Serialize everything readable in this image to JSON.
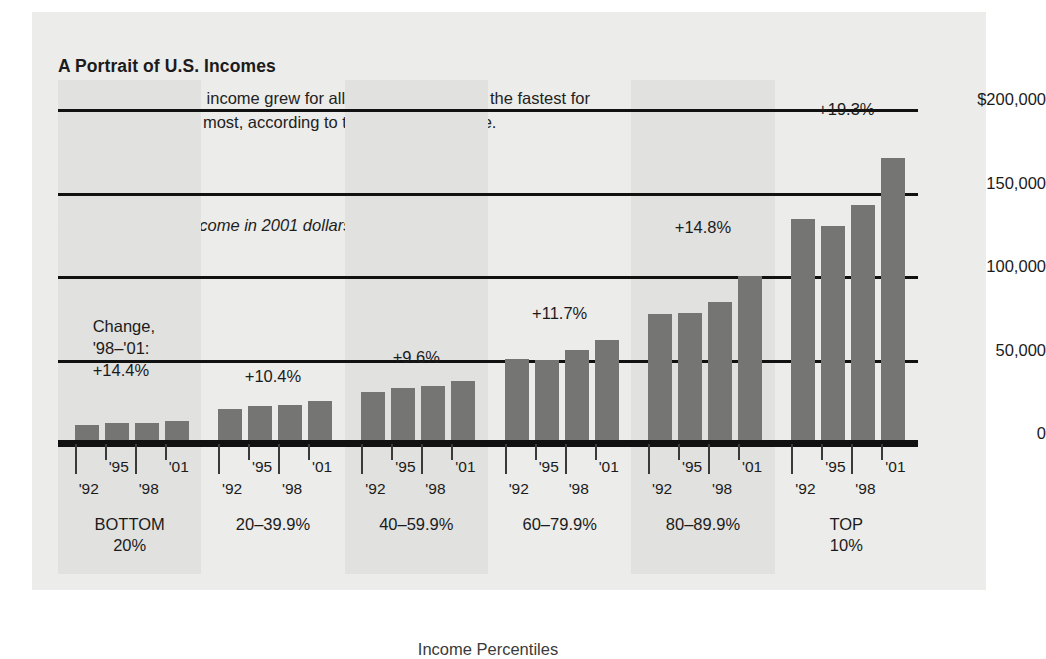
{
  "title": "A Portrait of U.S. Incomes",
  "deck": "From 1998 to 2001, income grew for all groups, but it grew the fastest for those who earn the most, according to the Federal Reserve.",
  "subhead": "Before-tax family income in 2001 dollars, by income level.",
  "x_caption": "Income Percentiles",
  "change_legend": {
    "line1": "Change,",
    "line2": "'98–'01:",
    "line3": "+14.4%"
  },
  "colors": {
    "bar": "#757573",
    "panel": "#ececea",
    "band": "#e1e1df",
    "rule": "#111111"
  },
  "chart_data": {
    "type": "bar",
    "title": "A Portrait of U.S. Incomes",
    "subtitle": "Before-tax family income in 2001 dollars, by income level.",
    "xlabel": "Income Percentiles",
    "ylabel": "",
    "ylim": [
      0,
      200000
    ],
    "grid": true,
    "legend": "none",
    "ytick_labels": [
      "$200,000",
      "150,000",
      "100,000",
      "50,000",
      "0"
    ],
    "ytick_values": [
      200000,
      150000,
      100000,
      50000,
      0
    ],
    "categories": [
      "'92",
      "'95",
      "'98",
      "'01"
    ],
    "groups": [
      {
        "name": "BOTTOM\n20%",
        "change_label": "+14.4%",
        "change_label_inline": false,
        "shaded": true,
        "values": [
          11500,
          12500,
          12500,
          13500
        ]
      },
      {
        "name": "20–39.9%",
        "change_label": "+10.4%",
        "change_label_inline": true,
        "shaded": false,
        "values": [
          21000,
          22500,
          23500,
          26000
        ]
      },
      {
        "name": "40–59.9%",
        "change_label": "+9.6%",
        "change_label_inline": true,
        "shaded": true,
        "values": [
          31000,
          33500,
          34500,
          38000
        ]
      },
      {
        "name": "60–79.9%",
        "change_label": "+11.7%",
        "change_label_inline": true,
        "shaded": false,
        "values": [
          51000,
          50500,
          56000,
          62500
        ]
      },
      {
        "name": "80–89.9%",
        "change_label": "+14.8%",
        "change_label_inline": true,
        "shaded": true,
        "values": [
          78000,
          78500,
          85000,
          100500
        ]
      },
      {
        "name": "TOP\n10%",
        "change_label": "+19.3%",
        "change_label_inline": true,
        "shaded": false,
        "values": [
          135000,
          130500,
          143000,
          171000
        ]
      }
    ]
  }
}
